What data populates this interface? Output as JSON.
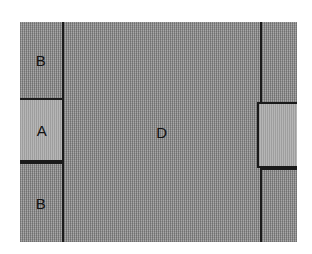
{
  "figure": {
    "title": "",
    "kind": "schematic-block-diagram",
    "colors": {
      "outline": "#1a1a1a",
      "fill_dark": "#949494",
      "fill_light": "#a8a8a8",
      "background": "#ffffff",
      "label_text": "#111111"
    },
    "regions": [
      {
        "id": "left-top",
        "label": "B",
        "fill": "dark",
        "column": "left"
      },
      {
        "id": "left-middle",
        "label": "A",
        "fill": "light",
        "column": "left"
      },
      {
        "id": "left-bottom",
        "label": "B",
        "fill": "dark",
        "column": "left"
      },
      {
        "id": "center",
        "label": "D",
        "fill": "dark",
        "column": "center"
      },
      {
        "id": "right-top",
        "label": "",
        "fill": "dark",
        "column": "right"
      },
      {
        "id": "right-middle",
        "label": "",
        "fill": "light",
        "column": "right"
      },
      {
        "id": "right-bottom",
        "label": "",
        "fill": "dark",
        "column": "right"
      }
    ]
  }
}
